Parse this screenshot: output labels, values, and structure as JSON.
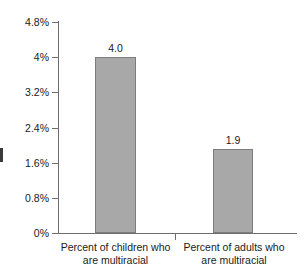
{
  "chart_data": {
    "type": "bar",
    "title": "",
    "subtitle": "",
    "xlabel": "",
    "ylabel": "",
    "categories": [
      "Percent of children who are multiracial",
      "Percent of adults who are multiracial"
    ],
    "category_lines": [
      [
        "Percent of children who",
        "are multiracial"
      ],
      [
        "Percent of adults who",
        "are multiracial"
      ]
    ],
    "values": [
      4.0,
      1.9
    ],
    "value_labels": [
      "4.0",
      "1.9"
    ],
    "ylim": [
      0,
      4.8
    ],
    "ytick_values": [
      0,
      0.8,
      1.6,
      2.4,
      3.2,
      4.0,
      4.8
    ],
    "ytick_labels": [
      "0%",
      "0.8%",
      "1.6%",
      "2.4%",
      "3.2%",
      "4%",
      "4.8%"
    ],
    "grid": false,
    "legend": null,
    "legend_position": "none",
    "annotations": [],
    "colors": {
      "bar_fill": "#a8a8a8",
      "bar_border": "#7d7d7d",
      "axis": "#6e6e6e",
      "text": "#1a1a1a",
      "background": "#ffffff"
    }
  }
}
